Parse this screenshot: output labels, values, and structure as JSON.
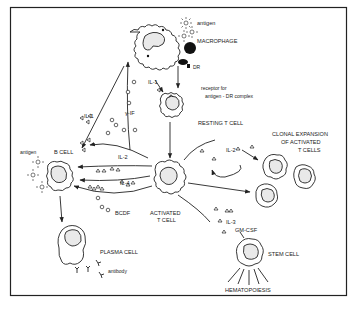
{
  "figure": {
    "cells": {
      "macrophage": "MACROPHAGE",
      "resting_t_cell": "RESTING T CELL",
      "activated_t_cell_line1": "ACTIVATED",
      "activated_t_cell_line2": "T CELL",
      "b_cell": "B CELL",
      "plasma_cell": "PLASMA CELL",
      "stem_cell": "STEM CELL",
      "clonal_line1": "CLONAL EXPANSION",
      "clonal_line2": "OF ACTIVATED",
      "clonal_line3": "T CELLS"
    },
    "labels": {
      "antigen_top": "antigen",
      "antigen_left": "antigen",
      "dr": "DR",
      "receptor_line1": "receptor for",
      "receptor_line2": "antigen - DR complex",
      "il1_a": "IL-1",
      "il1_b": "IL-1",
      "gamma_if": "γ-IF",
      "il2_left": "IL-2",
      "il2_right": "IL-2",
      "il4": "IL-4",
      "bcdf": "BCDF",
      "il3": "IL-3",
      "gmcsf": "GM-CSF",
      "antibody": "antibody",
      "hematopoiesis": "HEMATOPOIESIS"
    }
  }
}
